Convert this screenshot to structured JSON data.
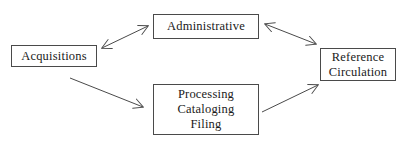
{
  "diagram": {
    "background_color": "#ffffff",
    "line_color": "#4a4a4a",
    "text_color": "#1a1a1a",
    "nodes": [
      {
        "id": "acquisitions",
        "label": "Acquisitions",
        "lines": [
          "Acquisitions"
        ]
      },
      {
        "id": "administrative",
        "label": "Administrative",
        "lines": [
          "Administrative"
        ]
      },
      {
        "id": "processing",
        "label": "Processing Cataloging Filing",
        "lines": [
          "Processing",
          "Cataloging",
          "Filing"
        ]
      },
      {
        "id": "reference",
        "label": "Reference Circulation",
        "lines": [
          "Reference",
          "Circulation"
        ]
      }
    ],
    "edges": [
      {
        "id": "acquisitions-administrative",
        "from": "acquisitions",
        "to": "administrative",
        "direction": "bidirectional"
      },
      {
        "id": "administrative-reference",
        "from": "administrative",
        "to": "reference",
        "direction": "bidirectional"
      },
      {
        "id": "acquisitions-processing",
        "from": "acquisitions",
        "to": "processing",
        "direction": "forward"
      },
      {
        "id": "processing-reference",
        "from": "processing",
        "to": "reference",
        "direction": "forward"
      }
    ]
  }
}
